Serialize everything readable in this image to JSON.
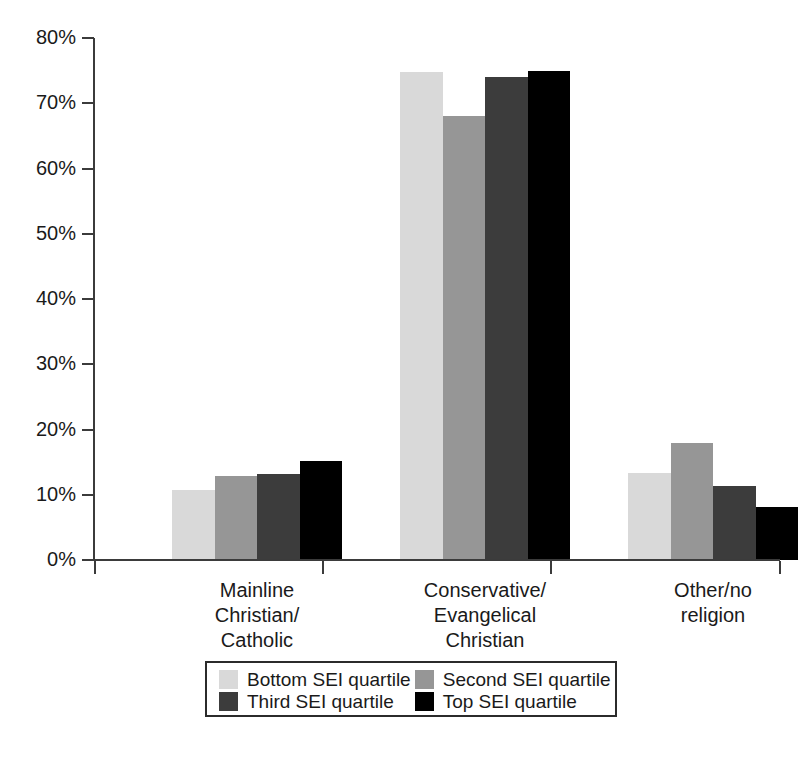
{
  "chart_data": {
    "type": "bar",
    "title": "",
    "subtitle": "",
    "xlabel": "",
    "ylabel": "",
    "ylim": [
      0,
      80
    ],
    "ytick_values": [
      0,
      10,
      20,
      30,
      40,
      50,
      60,
      70,
      80
    ],
    "ytick_labels": [
      "0%",
      "10%",
      "20%",
      "30%",
      "40%",
      "50%",
      "60%",
      "70%",
      "80%"
    ],
    "grid": false,
    "legend_position": "bottom",
    "categories": [
      "Mainline Christian/ Catholic",
      "Conservative/ Evangelical Christian",
      "Other/no religion"
    ],
    "category_lines": [
      [
        "Mainline",
        "Christian/",
        "Catholic"
      ],
      [
        "Conservative/",
        "Evangelical",
        "Christian"
      ],
      [
        "Other/no",
        "religion"
      ]
    ],
    "series": [
      {
        "name": "Bottom SEI quartile",
        "color": "#d9d9d9",
        "values": [
          10.8,
          74.8,
          13.4
        ]
      },
      {
        "name": "Second SEI quartile",
        "color": "#969696",
        "values": [
          12.8,
          68.0,
          18.0
        ]
      },
      {
        "name": "Third SEI quartile",
        "color": "#3c3c3c",
        "values": [
          13.2,
          74.0,
          11.4
        ]
      },
      {
        "name": "Top SEI quartile",
        "color": "#000000",
        "values": [
          15.2,
          75.0,
          8.2
        ]
      }
    ]
  },
  "legend": {
    "entries": [
      {
        "label": "Bottom SEI quartile",
        "color": "#d9d9d9"
      },
      {
        "label": "Second SEI quartile",
        "color": "#969696"
      },
      {
        "label": "Third SEI quartile",
        "color": "#3c3c3c"
      },
      {
        "label": "Top SEI quartile",
        "color": "#000000"
      }
    ]
  },
  "axis": {
    "line_color": "#3b3b3b"
  }
}
